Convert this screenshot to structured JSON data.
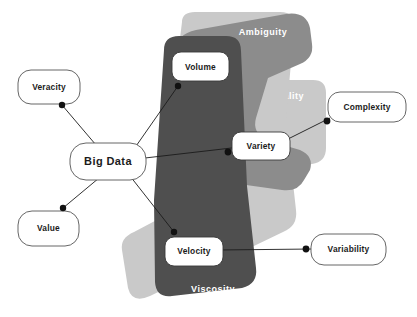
{
  "diagram": {
    "central_node": {
      "label": "Big Data"
    },
    "zones": [
      {
        "name": "ambiguity",
        "label": "Ambiguity",
        "color": "#8c8c8c",
        "label_x": 263,
        "label_y": 33
      },
      {
        "name": "virality",
        "label": "Virality",
        "color": "#c9c9c9",
        "label_x": 287,
        "label_y": 97
      },
      {
        "name": "viscosity",
        "label": "Viscosity",
        "color": "#4f4f4f",
        "label_x": 213,
        "label_y": 290
      }
    ],
    "inner_nodes": [
      {
        "name": "volume",
        "label": "Volume",
        "x": 172,
        "y": 52,
        "w": 57,
        "h": 29
      },
      {
        "name": "variety",
        "label": "Variety",
        "x": 232,
        "y": 132,
        "w": 58,
        "h": 28
      },
      {
        "name": "velocity",
        "label": "Velocity",
        "x": 165,
        "y": 237,
        "w": 58,
        "h": 29
      }
    ],
    "outer_nodes": [
      {
        "name": "veracity",
        "label": "Veracity",
        "x": 18,
        "y": 70,
        "w": 62,
        "h": 34
      },
      {
        "name": "value",
        "label": "Value",
        "x": 18,
        "y": 211,
        "w": 61,
        "h": 35
      },
      {
        "name": "complexity",
        "label": "Complexity",
        "x": 328,
        "y": 92,
        "w": 78,
        "h": 30
      },
      {
        "name": "variability",
        "label": "Variability",
        "x": 311,
        "y": 234,
        "w": 75,
        "h": 31
      }
    ],
    "connections": [
      {
        "from": "big-data",
        "to": "veracity",
        "dot_x": 62,
        "dot_y": 105
      },
      {
        "from": "big-data",
        "to": "value",
        "dot_x": 63,
        "dot_y": 208
      },
      {
        "from": "big-data",
        "to": "volume",
        "dot_x": 178,
        "dot_y": 86
      },
      {
        "from": "big-data",
        "to": "velocity",
        "dot_x": 174,
        "dot_y": 232
      },
      {
        "from": "big-data",
        "to": "variety",
        "dot_x": 228,
        "dot_y": 152
      },
      {
        "from": "variety",
        "to": "complexity",
        "dot_x": 327,
        "dot_y": 121
      },
      {
        "from": "velocity",
        "to": "variability",
        "dot_x": 306,
        "dot_y": 249
      }
    ],
    "colors": {
      "background": "#ffffff",
      "dark_zone": "#4f4f4f",
      "medium_zone": "#8c8c8c",
      "light_zone": "#c9c9c9",
      "node_fill": "#ffffff",
      "node_stroke": "#3a3a3a",
      "text_dark": "#1b1b1b",
      "text_light": "#ffffff"
    }
  }
}
